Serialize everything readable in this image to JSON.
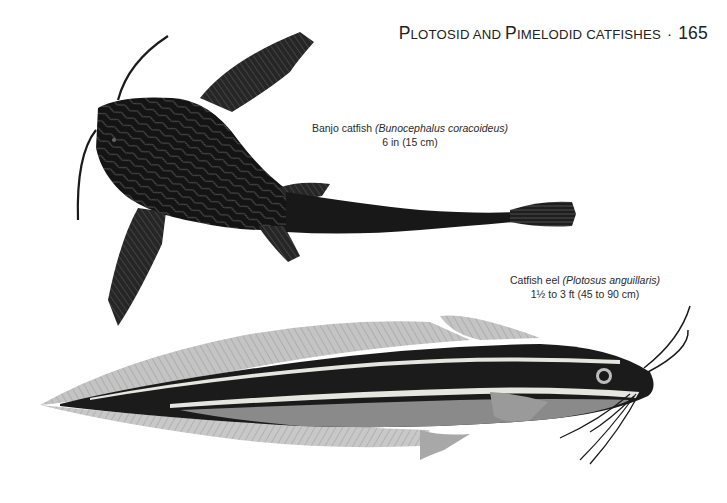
{
  "header": {
    "title_first_letter": "P",
    "title_rest_1": "LOTOSID AND ",
    "title_letter_2": "P",
    "title_rest_2": "IMELODID CATFISHES",
    "title_full": "Plotosid and Pimelodid Catfishes",
    "separator": "·",
    "page_number": "165"
  },
  "illustrations": [
    {
      "id": "banjo",
      "common_name": "Banjo catfish",
      "scientific_name": "(Bunocephalus coracoideus)",
      "size": "6 in (15 cm)",
      "colors": {
        "body": "#141414",
        "mottle": "#5a5a5a",
        "fin": "#2a2a2a"
      }
    },
    {
      "id": "eel",
      "common_name": "Catfish eel",
      "scientific_name": "(Plotosus anguillaris)",
      "size": "1½ to 3 ft (45 to 90 cm)",
      "colors": {
        "back": "#1b1b1b",
        "stripe": "#e6e6e0",
        "belly": "#8a8a8a",
        "fin": "#bdbdbd"
      }
    }
  ]
}
